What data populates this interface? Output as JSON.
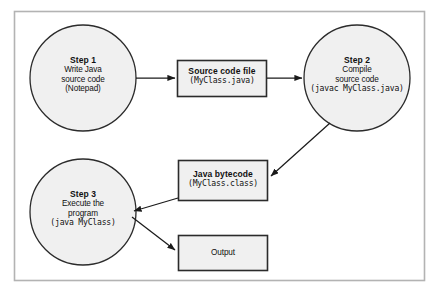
{
  "diagram": {
    "type": "flowchart",
    "frame": {
      "border_color": "#b0b0b0",
      "background": "#ffffff"
    },
    "style": {
      "node_fill": "#f0f0f0",
      "circle_stroke": "#2b2b2b",
      "box_stroke": "#2b2b2b",
      "arrow_color": "#1a1a1a"
    },
    "nodes": [
      {
        "id": "step1",
        "shape": "circle",
        "title": "Step 1",
        "lines": [
          "Write Java",
          "source code",
          "(Notepad)"
        ],
        "mono_lines": []
      },
      {
        "id": "source-file",
        "shape": "rectangle",
        "title": "Source code file",
        "lines": [],
        "mono_lines": [
          "(MyClass.java)"
        ]
      },
      {
        "id": "step2",
        "shape": "circle",
        "title": "Step 2",
        "lines": [
          "Compile",
          "source code"
        ],
        "mono_lines": [
          "(javac MyClass.java)"
        ]
      },
      {
        "id": "bytecode",
        "shape": "rectangle",
        "title": "Java bytecode",
        "lines": [],
        "mono_lines": [
          "(MyClass.class)"
        ]
      },
      {
        "id": "step3",
        "shape": "circle",
        "title": "Step 3",
        "lines": [
          "Execute the",
          "program"
        ],
        "mono_lines": [
          "(java MyClass)"
        ]
      },
      {
        "id": "output",
        "shape": "rectangle",
        "title": "",
        "lines": [
          "Output"
        ],
        "mono_lines": []
      }
    ],
    "edges": [
      {
        "from": "step1",
        "to": "source-file",
        "style": "straight-horizontal"
      },
      {
        "from": "source-file",
        "to": "step2",
        "style": "straight-horizontal"
      },
      {
        "from": "step2",
        "to": "bytecode",
        "style": "diagonal"
      },
      {
        "from": "bytecode",
        "to": "step3",
        "style": "diagonal"
      },
      {
        "from": "step3",
        "to": "output",
        "style": "diagonal"
      }
    ]
  }
}
